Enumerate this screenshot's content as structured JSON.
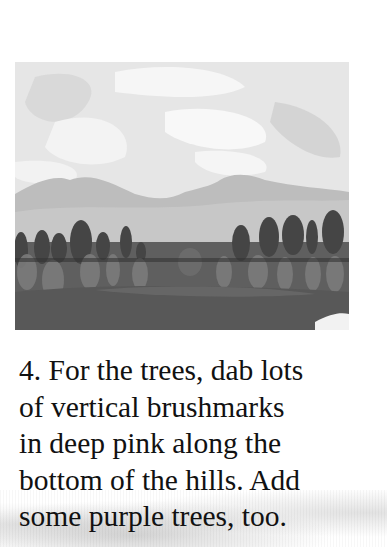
{
  "illustration": {
    "description": "painted landscape: light cloudy sky, two grey hills, row of dark and mid-tone rounded trees, dark foreground field",
    "colors": {
      "sky": "#e8e8e8",
      "clouds_light": "#f7f7f7",
      "clouds_dark": "#d2d2d2",
      "hills": "#b5b5b5",
      "hills_far": "#c7c7c7",
      "trees_dark": "#4a4a4a",
      "trees_mid": "#7a7a7a",
      "field": "#5a5a5a"
    }
  },
  "instruction": {
    "step_number": "4.",
    "lines": [
      "4. For the trees, dab lots",
      "of vertical brushmarks",
      "in deep pink along the",
      "bottom of the hills. Add",
      "some purple trees, too."
    ]
  }
}
